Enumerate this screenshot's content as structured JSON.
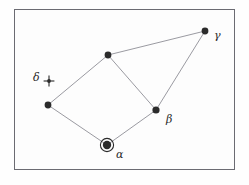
{
  "figure": {
    "kind": "star-chart-diagram",
    "background_color": "#fefefe",
    "frame": {
      "border_color": "#6b6b72",
      "fill_color": "#fdfdfd",
      "x": 14,
      "y": 9,
      "width": 221,
      "height": 161
    },
    "line_color": "#8f8f96",
    "node_color": "#2b2b2b"
  },
  "nodes": [
    {
      "id": "alpha",
      "label": "α",
      "marker": "dot-with-ring",
      "x": 107,
      "y": 145,
      "radius": 4.2,
      "ring_radius": 6.6,
      "label_x": 116,
      "label_y": 149
    },
    {
      "id": "beta",
      "label": "β",
      "marker": "dot",
      "x": 156,
      "y": 110,
      "radius": 3.6,
      "label_x": 166,
      "label_y": 114
    },
    {
      "id": "gamma",
      "label": "γ",
      "marker": "dot",
      "x": 205,
      "y": 31,
      "radius": 3.4,
      "label_x": 214,
      "label_y": 30
    },
    {
      "id": "delta",
      "label": "δ",
      "marker": "cross-with-dot",
      "x": 49,
      "y": 81,
      "radius": 1.9,
      "cross_arm": 5.4,
      "label_x": 33,
      "label_y": 72
    },
    {
      "id": "top-vertex",
      "label": "",
      "marker": "dot",
      "x": 108,
      "y": 55,
      "radius": 3.4,
      "label_x": 0,
      "label_y": 0
    },
    {
      "id": "left-vertex",
      "label": "",
      "marker": "dot",
      "x": 48,
      "y": 105,
      "radius": 3.4,
      "label_x": 0,
      "label_y": 0
    }
  ],
  "edges": [
    {
      "id": "edge-top-gamma",
      "from": "top-vertex",
      "to": "gamma"
    },
    {
      "id": "edge-top-beta",
      "from": "top-vertex",
      "to": "beta"
    },
    {
      "id": "edge-beta-gamma",
      "from": "beta",
      "to": "gamma"
    },
    {
      "id": "edge-top-left",
      "from": "top-vertex",
      "to": "left-vertex"
    },
    {
      "id": "edge-left-alpha",
      "from": "left-vertex",
      "to": "alpha"
    },
    {
      "id": "edge-alpha-beta",
      "from": "alpha",
      "to": "beta"
    }
  ]
}
